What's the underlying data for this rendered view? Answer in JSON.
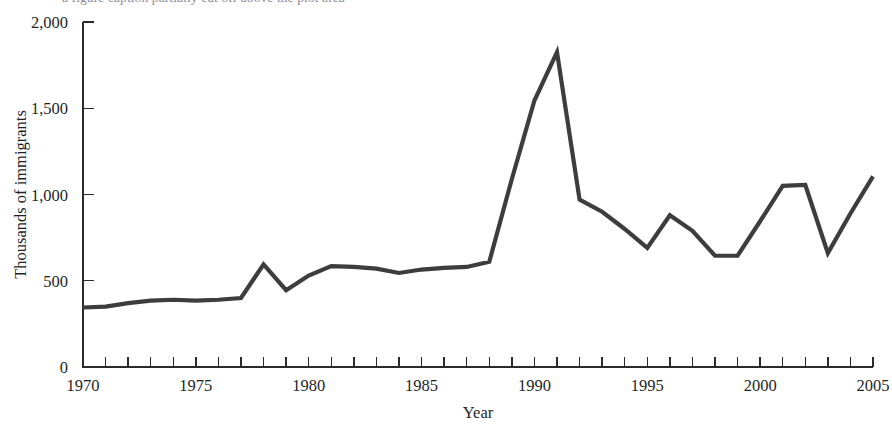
{
  "figure": {
    "caption_partial": "a figure caption partially cut off above the plot area",
    "background_color": "#ffffff"
  },
  "chart_data": {
    "type": "line",
    "title": "",
    "xlabel": "Year",
    "ylabel": "Thousands of immigrants",
    "xlim": [
      1970,
      2005
    ],
    "ylim": [
      0,
      2000
    ],
    "grid": false,
    "legend": null,
    "line_color": "#3d3d3d",
    "x_tick_labels": [
      "1970",
      "1975",
      "1980",
      "1985",
      "1990",
      "1995",
      "2000",
      "2005"
    ],
    "x_tick_values": [
      1970,
      1975,
      1980,
      1985,
      1990,
      1995,
      2000,
      2005
    ],
    "x_minor_tick_interval": 1,
    "y_tick_labels": [
      "0",
      "500",
      "1,000",
      "1,500",
      "2,000"
    ],
    "y_tick_values": [
      0,
      500,
      1000,
      1500,
      2000
    ],
    "x": [
      1970,
      1971,
      1972,
      1973,
      1974,
      1975,
      1976,
      1977,
      1978,
      1979,
      1980,
      1981,
      1982,
      1983,
      1984,
      1985,
      1986,
      1987,
      1988,
      1989,
      1990,
      1991,
      1992,
      1993,
      1994,
      1995,
      1996,
      1997,
      1998,
      1999,
      2000,
      2001,
      2002,
      2003,
      2004,
      2005
    ],
    "values": [
      345,
      350,
      370,
      385,
      390,
      385,
      390,
      400,
      595,
      445,
      530,
      585,
      580,
      570,
      545,
      565,
      575,
      580,
      610,
      1090,
      1545,
      1825,
      970,
      900,
      800,
      690,
      880,
      790,
      645,
      645,
      845,
      1050,
      1055,
      660,
      890,
      1105
    ],
    "series": [
      {
        "name": "Immigrants admitted",
        "values": [
          345,
          350,
          370,
          385,
          390,
          385,
          390,
          400,
          595,
          445,
          530,
          585,
          580,
          570,
          545,
          565,
          575,
          580,
          610,
          1090,
          1545,
          1825,
          970,
          900,
          800,
          690,
          880,
          790,
          645,
          645,
          845,
          1050,
          1055,
          660,
          890,
          1105
        ]
      }
    ],
    "annotations": []
  }
}
